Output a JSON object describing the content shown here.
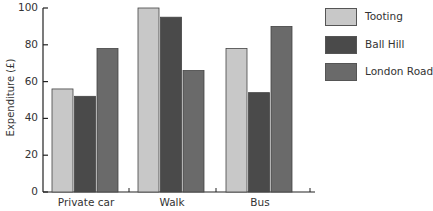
{
  "chart_data": {
    "type": "bar",
    "title": "",
    "xlabel": "",
    "ylabel": "Expenditure (£)",
    "ylim": [
      0,
      100
    ],
    "yticks": [
      0,
      20,
      40,
      60,
      80,
      100
    ],
    "grid": false,
    "legend_position": "right",
    "categories": [
      "Private car",
      "Walk",
      "Bus"
    ],
    "series": [
      {
        "name": "Tooting",
        "color": "#c8c8c8",
        "values": [
          56,
          100,
          78
        ]
      },
      {
        "name": "Ball Hill",
        "color": "#4a4a4a",
        "values": [
          52,
          95,
          54
        ]
      },
      {
        "name": "London Road",
        "color": "#6a6a6a",
        "values": [
          78,
          66,
          90
        ]
      }
    ]
  },
  "axis": {
    "ylabel": "Expenditure (£)",
    "yticks": [
      "0",
      "20",
      "40",
      "60",
      "80",
      "100"
    ],
    "xticks": [
      "Private car",
      "Walk",
      "Bus"
    ]
  },
  "legend": {
    "items": [
      {
        "label": "Tooting",
        "color": "#c8c8c8"
      },
      {
        "label": "Ball Hill",
        "color": "#4a4a4a"
      },
      {
        "label": "London Road",
        "color": "#6a6a6a"
      }
    ]
  }
}
